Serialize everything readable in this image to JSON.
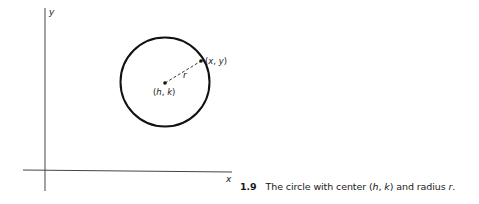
{
  "figure": {
    "axes": {
      "x_label": "x",
      "y_label": "y"
    },
    "circle": {
      "center_label_open": "(",
      "center_h": "h",
      "center_sep": ", ",
      "center_k": "k",
      "center_label_close": ")",
      "point_label_open": "(",
      "point_x": "x",
      "point_sep": ", ",
      "point_y": "y",
      "point_label_close": ")",
      "radius_label": "r"
    },
    "caption": {
      "number": "1.9",
      "text_before": "The circle with center (",
      "h": "h",
      "sep": ", ",
      "k": "k",
      "text_middle": ") and radius ",
      "r": "r",
      "text_end": "."
    }
  },
  "colors": {
    "ink": "#1a1a1a",
    "axis": "#333333",
    "background": "#ffffff"
  }
}
